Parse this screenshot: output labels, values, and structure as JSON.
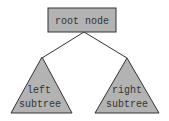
{
  "diagram": {
    "root": {
      "label": "root node"
    },
    "left": {
      "line1": "left",
      "line2": "subtree"
    },
    "right": {
      "line1": "right",
      "line2": "subtree"
    },
    "colors": {
      "fill": "#b3b3b3",
      "stroke": "#333333",
      "edge": "#333333"
    }
  }
}
